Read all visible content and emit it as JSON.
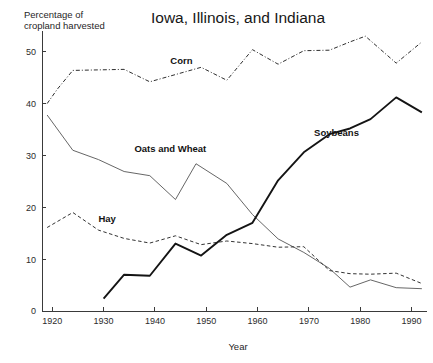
{
  "chart_data": {
    "type": "line",
    "title": "Iowa, Illinois, and Indiana",
    "xlabel": "Year",
    "ylabel": "Percentage of cropland harvested",
    "ylabel_line1": "Percentage of",
    "ylabel_line2": "cropland harvested",
    "xlim": [
      1918,
      1993
    ],
    "ylim": [
      0,
      54
    ],
    "xticks": [
      1920,
      1930,
      1940,
      1950,
      1960,
      1970,
      1980,
      1990
    ],
    "yticks": [
      0,
      10,
      20,
      30,
      40,
      50
    ],
    "grid": false,
    "legend_position": "inline-labels",
    "series": [
      {
        "name": "Corn",
        "style": "dash-dot",
        "color": "#2e2e2e",
        "label_x": 1943,
        "label_y": 47.6,
        "points": [
          [
            1919,
            40.0
          ],
          [
            1921,
            42.8
          ],
          [
            1924,
            46.4
          ],
          [
            1929,
            46.5
          ],
          [
            1934,
            46.6
          ],
          [
            1939,
            44.2
          ],
          [
            1944,
            45.6
          ],
          [
            1949,
            47.0
          ],
          [
            1954,
            44.5
          ],
          [
            1959,
            50.4
          ],
          [
            1964,
            47.6
          ],
          [
            1969,
            50.2
          ],
          [
            1974,
            50.3
          ],
          [
            1978,
            51.9
          ],
          [
            1981,
            53.0
          ],
          [
            1987,
            47.8
          ],
          [
            1992,
            51.9
          ]
        ]
      },
      {
        "name": "Oats and Wheat",
        "style": "solid-thin",
        "color": "#555555",
        "label_x": 1936,
        "label_y": 30.6,
        "points": [
          [
            1919,
            37.8
          ],
          [
            1924,
            31.0
          ],
          [
            1929,
            29.2
          ],
          [
            1934,
            26.9
          ],
          [
            1939,
            26.1
          ],
          [
            1944,
            21.5
          ],
          [
            1948,
            28.4
          ],
          [
            1954,
            24.6
          ],
          [
            1959,
            18.6
          ],
          [
            1964,
            13.9
          ],
          [
            1969,
            11.3
          ],
          [
            1974,
            8.2
          ],
          [
            1978,
            4.6
          ],
          [
            1982,
            6.0
          ],
          [
            1987,
            4.5
          ],
          [
            1992,
            4.3
          ]
        ]
      },
      {
        "name": "Hay",
        "style": "dashed",
        "color": "#333333",
        "label_x": 1929,
        "label_y": 17.1,
        "points": [
          [
            1919,
            16.1
          ],
          [
            1924,
            19.0
          ],
          [
            1929,
            15.6
          ],
          [
            1934,
            14.0
          ],
          [
            1939,
            13.1
          ],
          [
            1944,
            14.5
          ],
          [
            1949,
            12.8
          ],
          [
            1954,
            13.5
          ],
          [
            1959,
            13.0
          ],
          [
            1964,
            12.3
          ],
          [
            1969,
            12.4
          ],
          [
            1974,
            7.8
          ],
          [
            1978,
            7.2
          ],
          [
            1982,
            7.1
          ],
          [
            1987,
            7.3
          ],
          [
            1992,
            5.3
          ]
        ]
      },
      {
        "name": "Soybeans",
        "style": "solid-thick",
        "color": "#141414",
        "label_x": 1971,
        "label_y": 33.7,
        "points": [
          [
            1930,
            2.4
          ],
          [
            1934,
            7.0
          ],
          [
            1939,
            6.8
          ],
          [
            1944,
            13.0
          ],
          [
            1949,
            10.7
          ],
          [
            1954,
            14.7
          ],
          [
            1959,
            17.0
          ],
          [
            1964,
            25.2
          ],
          [
            1969,
            30.6
          ],
          [
            1974,
            34.1
          ],
          [
            1978,
            35.2
          ],
          [
            1982,
            37.0
          ],
          [
            1987,
            41.2
          ],
          [
            1992,
            38.3
          ]
        ]
      }
    ]
  }
}
